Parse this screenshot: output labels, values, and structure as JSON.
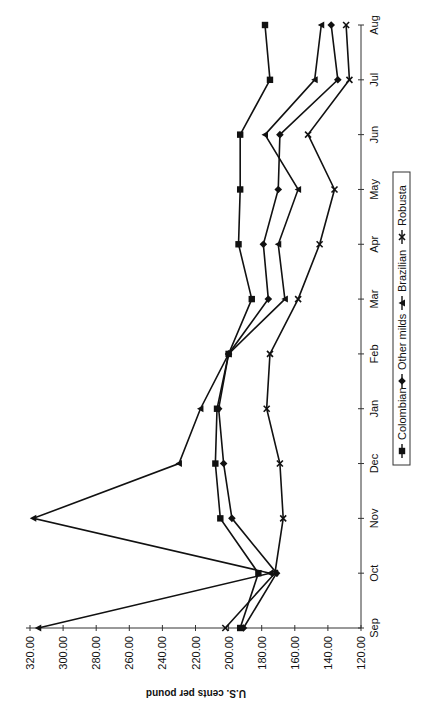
{
  "chart_data": {
    "type": "line",
    "title": "",
    "orientation": "rotated-90-ccw",
    "xlabel": "",
    "ylabel": "U.S. cents per pound",
    "categories": [
      "Sep",
      "Oct",
      "Nov",
      "Dec",
      "Jan",
      "Feb",
      "Mar",
      "Apr",
      "May",
      "Jun",
      "Jul",
      "Aug"
    ],
    "ylim": [
      120,
      320
    ],
    "yticks": [
      "320.00",
      "300.00",
      "280.00",
      "260.00",
      "240.00",
      "220.00",
      "200.00",
      "180.00",
      "160.00",
      "140.00",
      "120.00"
    ],
    "ytick_values": [
      320,
      300,
      280,
      260,
      240,
      220,
      200,
      180,
      160,
      140,
      120
    ],
    "grid": false,
    "legend_position": "bottom",
    "series": [
      {
        "name": "Colombian",
        "marker": "square",
        "values": [
          193,
          182,
          205,
          208,
          207,
          200,
          186,
          194,
          193,
          193,
          175,
          178
        ]
      },
      {
        "name": "Other milds",
        "marker": "diamond",
        "values": [
          191,
          171,
          198,
          203,
          206,
          200,
          176,
          179,
          170,
          169,
          134,
          138
        ]
      },
      {
        "name": "Brazilian",
        "marker": "triangle",
        "values": [
          315,
          175,
          318,
          230,
          217,
          200,
          166,
          170,
          158,
          178,
          148,
          144
        ]
      },
      {
        "name": "Robusta",
        "marker": "x",
        "values": [
          202,
          172,
          167,
          169,
          177,
          175,
          158,
          145,
          136,
          152,
          127,
          129
        ]
      }
    ]
  }
}
